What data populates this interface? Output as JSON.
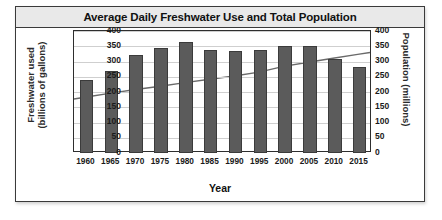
{
  "chart": {
    "title": "Average Daily Freshwater Use and Total Population",
    "xlabel": "Year",
    "ylabel_left_line1": "Freshwater used",
    "ylabel_left_line2": "(billions of gallons)",
    "ylabel_right": "Population (millions)"
  },
  "chart_data": {
    "type": "bar",
    "title": "Average Daily Freshwater Use and Total Population",
    "xlabel": "Year",
    "ylabel": "Freshwater used (billions of gallons)",
    "y2label": "Population (millions)",
    "categories": [
      "1960",
      "1965",
      "1970",
      "1975",
      "1980",
      "1985",
      "1990",
      "1995",
      "2000",
      "2005",
      "2010",
      "2015"
    ],
    "series": [
      {
        "name": "Freshwater used (billions of gallons)",
        "type": "bar",
        "axis": "left",
        "color": "#5b5b5b",
        "values": [
          240,
          270,
          320,
          343,
          365,
          338,
          335,
          338,
          352,
          352,
          307,
          282
        ]
      },
      {
        "name": "Population (millions)",
        "type": "line",
        "axis": "right",
        "color": "#6a6a6a",
        "values": [
          180,
          193,
          205,
          216,
          228,
          239,
          250,
          263,
          282,
          296,
          309,
          322
        ]
      }
    ],
    "ylim": [
      0,
      400
    ],
    "y2lim": [
      0,
      400
    ],
    "yticks": [
      0,
      50,
      100,
      150,
      200,
      250,
      300,
      350,
      400
    ],
    "y2ticks": [
      0,
      50,
      100,
      150,
      200,
      250,
      300,
      350,
      400
    ],
    "grid": true,
    "legend": false
  },
  "axis": {
    "left_ticks": [
      "400",
      "350",
      "300",
      "250",
      "200",
      "150",
      "100",
      "50",
      "0"
    ],
    "right_ticks": [
      "400",
      "350",
      "300",
      "250",
      "200",
      "150",
      "100",
      "50",
      "0"
    ]
  }
}
